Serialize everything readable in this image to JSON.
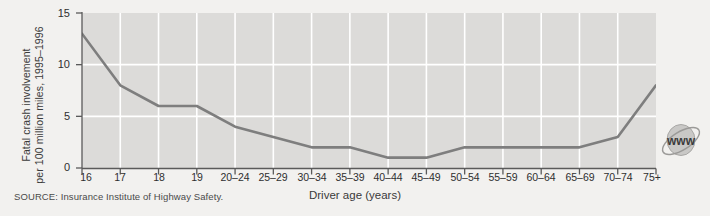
{
  "chart_data": {
    "type": "line",
    "title": "",
    "xlabel": "Driver age (years)",
    "ylabel": "Fatal crash involvement per 100 million miles, 1995–1996",
    "ylabel_line1": "Fatal crash involvement",
    "ylabel_line2": "per 100 million miles, 1995–1996",
    "categories": [
      "16",
      "17",
      "18",
      "19",
      "20–24",
      "25–29",
      "30–34",
      "35–39",
      "40–44",
      "45–49",
      "50–54",
      "55–59",
      "60–64",
      "65–69",
      "70–74",
      "75+"
    ],
    "values": [
      13,
      8,
      6,
      6,
      4,
      3,
      2,
      2,
      1,
      1,
      2,
      2,
      2,
      2,
      3,
      8
    ],
    "ylim": [
      0,
      15
    ],
    "yticks": [
      0,
      5,
      10,
      15
    ],
    "ytick_labels": [
      "0",
      "5",
      "10",
      "15"
    ],
    "grid": true,
    "grid_color": "#ffffff",
    "legend": "none",
    "series": [
      {
        "name": "Fatal crash involvement rate",
        "values": [
          13,
          8,
          6,
          6,
          4,
          3,
          2,
          2,
          1,
          1,
          2,
          2,
          2,
          2,
          3,
          8
        ]
      }
    ]
  },
  "figure": {
    "source_note": "SOURCE: Insurance Institute of Highway Safety.",
    "plot_bg_color": "#dcdbd9",
    "page_bg_color": "#f2f1ef",
    "line_color": "#7e7e7e",
    "axis_color": "#5a5a5a",
    "text_color": "#2f2f2f"
  },
  "watermark": {
    "label": "www",
    "icon": "globe-www-icon"
  }
}
